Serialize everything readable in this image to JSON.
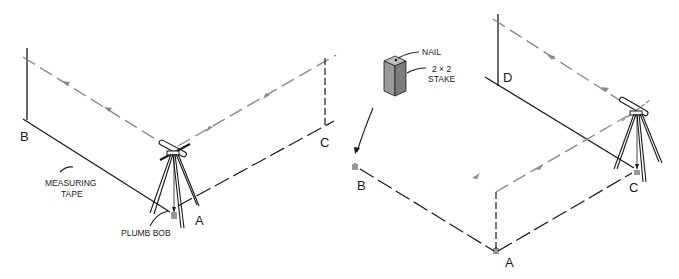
{
  "left_diagram": {
    "corner_labels": {
      "b": "B",
      "c": "C",
      "a": "A"
    },
    "callouts": {
      "measuring_tape_line1": "MEASURING",
      "measuring_tape_line2": "TAPE",
      "plumb_bob": "PLUMB BOB"
    }
  },
  "right_diagram": {
    "corner_labels": {
      "d": "D",
      "b": "B",
      "c": "C",
      "a": "A"
    },
    "callouts": {
      "nail": "NAIL",
      "stake_line1": "2 × 2",
      "stake_line2": "STAKE"
    }
  },
  "colors": {
    "ink": "#1a1a1a",
    "sight_line": "#8a8a8a",
    "stake_fill": "#9a9a9a"
  }
}
